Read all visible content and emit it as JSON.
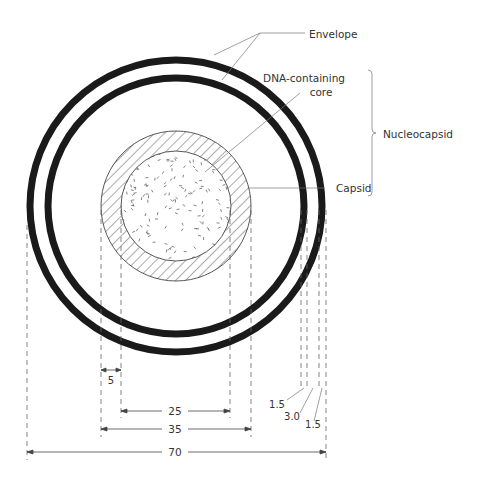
{
  "diagram": {
    "labels": {
      "envelope": "Envelope",
      "core_line1": "DNA-containing",
      "core_line2": "core",
      "nucleocapsid": "Nucleocapsid",
      "capsid": "Capsid"
    },
    "dimensions": {
      "capsid_thickness": "5",
      "core_diameter": "25",
      "capsid_diameter": "35",
      "total_diameter": "70",
      "inner_membrane": "1.5",
      "gap": "3.0",
      "outer_membrane": "1.5"
    },
    "colors": {
      "ink": "#1a1a1a",
      "line": "#555555"
    }
  }
}
